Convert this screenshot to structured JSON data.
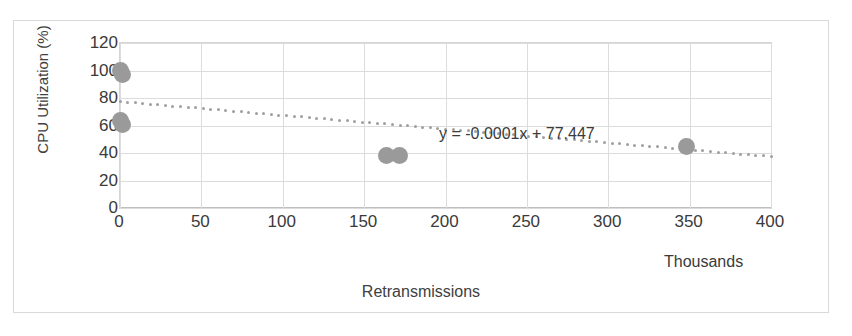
{
  "chart_data": {
    "type": "scatter",
    "title": "",
    "xlabel": "Retransmissions",
    "ylabel": "CPU Utilization (%)",
    "x_units_label": "Thousands",
    "xlim": [
      0,
      400
    ],
    "ylim": [
      0,
      120
    ],
    "x_ticks": [
      0,
      50,
      100,
      150,
      200,
      250,
      300,
      350,
      400
    ],
    "y_ticks": [
      0,
      20,
      40,
      60,
      80,
      100,
      120
    ],
    "grid": "horizontal-and-vertical",
    "legend": "none",
    "marker_color": "#9a9a9a",
    "trendline_color": "#9f9f9f",
    "points": [
      {
        "x": 0.5,
        "y": 100
      },
      {
        "x": 1.5,
        "y": 97
      },
      {
        "x": 0.5,
        "y": 64
      },
      {
        "x": 1.5,
        "y": 61
      },
      {
        "x": 164,
        "y": 38.5
      },
      {
        "x": 172,
        "y": 38.5
      },
      {
        "x": 348,
        "y": 45
      }
    ],
    "trendline": {
      "type": "linear-dotted",
      "equation": "y = -0.0001x + 77.447",
      "slope_per_unit": -0.0001,
      "intercept": 77.447,
      "x_start": 0,
      "x_end": 400,
      "y_start": 77.4,
      "y_end": 37.4
    },
    "annotations": [
      {
        "name": "trendline-equation",
        "text": "y = -0.0001x + 77.447"
      }
    ]
  }
}
